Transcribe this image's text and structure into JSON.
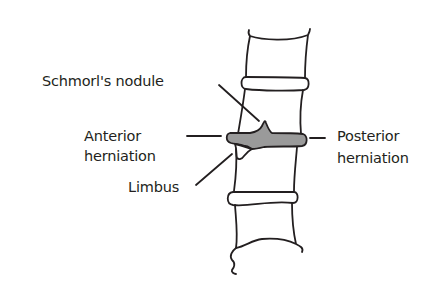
{
  "figure": {
    "colors": {
      "line": "#231f20",
      "herniation_fill": "#9a9a9a",
      "background": "#ffffff"
    },
    "labels": {
      "schmorls_nodule": "Schmorl's nodule",
      "anterior_line1": "Anterior",
      "anterior_line2": "herniation",
      "limbus": "Limbus",
      "posterior_line1": "Posterior",
      "posterior_line2": "herniation"
    }
  }
}
